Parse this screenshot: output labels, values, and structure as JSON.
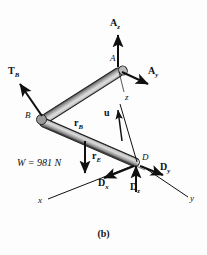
{
  "figure": {
    "caption": "(b)",
    "kind": "free-body-diagram"
  },
  "points": [
    {
      "id": "A",
      "label": "A",
      "x": 118,
      "y": 68
    },
    {
      "id": "B",
      "label": "B",
      "x": 40,
      "y": 118
    },
    {
      "id": "D",
      "label": "D",
      "x": 137,
      "y": 163
    }
  ],
  "axes": [
    {
      "name": "x-axis-label",
      "label": "x",
      "x": 40,
      "y": 202
    },
    {
      "name": "y-axis-label",
      "label": "y",
      "x": 192,
      "y": 200
    },
    {
      "name": "z-axis-label",
      "label": "z",
      "x": 125,
      "y": 99
    }
  ],
  "vectors": [
    {
      "name": "A_z",
      "base": "A",
      "label": "A",
      "subscript": "z",
      "style": "bold",
      "label_x": 112,
      "label_y": 25
    },
    {
      "name": "A_y",
      "base": "A",
      "label": "A",
      "subscript": "y",
      "style": "bold",
      "label_x": 144,
      "label_y": 72
    },
    {
      "name": "T_B",
      "base": "B",
      "label": "T",
      "subscript": "B",
      "style": "bold",
      "label_x": 10,
      "label_y": 72
    },
    {
      "name": "r_B",
      "base": "B",
      "label": "r",
      "subscript": "B",
      "style": "bold",
      "label_x": 78,
      "label_y": 124
    },
    {
      "name": "r_E",
      "base": "E",
      "label": "r",
      "subscript": "E",
      "style": "bold",
      "label_x": 95,
      "label_y": 157
    },
    {
      "name": "u",
      "base": "D",
      "label": "u",
      "subscript": "",
      "style": "bold",
      "label_x": 106,
      "label_y": 113
    },
    {
      "name": "D_x",
      "base": "D",
      "label": "D",
      "subscript": "x",
      "style": "bold",
      "label_x": 100,
      "label_y": 184
    },
    {
      "name": "D_y",
      "base": "D",
      "label": "D",
      "subscript": "y",
      "style": "bold",
      "label_x": 156,
      "label_y": 168
    },
    {
      "name": "D_z",
      "base": "D",
      "label": "D",
      "subscript": "z",
      "style": "bold",
      "label_x": 131,
      "label_y": 188
    }
  ],
  "weight": {
    "name": "weight-load",
    "text": "W = 981 N",
    "symbol": "W",
    "value": 981,
    "unit": "N",
    "label_x": 18,
    "label_y": 165
  },
  "colors": {
    "background": "#fdfdfd",
    "ink": "#101010",
    "rod_light": "#cdcdcd",
    "rod_mid": "#a3a3a3",
    "rod_dark": "#4a4a4a",
    "rod_outline": "#1b1b1b"
  }
}
